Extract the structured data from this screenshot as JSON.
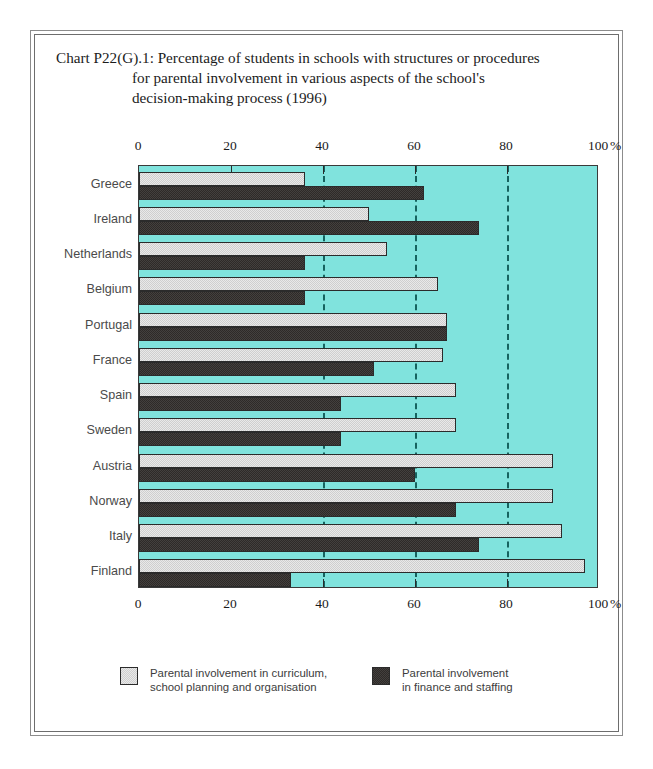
{
  "title": {
    "line1": "Chart P22(G).1: Percentage of students in schools with structures or procedures",
    "line2": "for parental involvement in various aspects of the school's",
    "line3": "decision-making process (1996)"
  },
  "axis": {
    "unit": "%",
    "ticks": [
      "0",
      "20",
      "40",
      "60",
      "80",
      "100"
    ]
  },
  "legend": {
    "items": [
      {
        "label": "Parental involvement in curriculum,\nschool planning and organisation",
        "color": "#cfcfcf",
        "swatch": "light"
      },
      {
        "label": "Parental involvement\nin finance and staffing",
        "color": "#2e2a28",
        "swatch": "dark"
      }
    ]
  },
  "colors": {
    "plot_background": "#80e3dd",
    "series_light": "#cfcfcf",
    "series_dark": "#2e2a28",
    "gridline": "#16635f",
    "frame": "#6d6d6d"
  },
  "chart_data": {
    "type": "bar",
    "orientation": "horizontal",
    "title": "Chart P22(G).1: Percentage of students in schools with structures or procedures for parental involvement in various aspects of the school's decision-making process (1996)",
    "xlabel": "%",
    "ylabel": "",
    "xlim": [
      0,
      100
    ],
    "xticks": [
      0,
      20,
      40,
      60,
      80,
      100
    ],
    "grid": true,
    "gridlines_dashed_at": [
      40,
      60,
      80
    ],
    "legend_position": "bottom",
    "categories": [
      "Greece",
      "Ireland",
      "Netherlands",
      "Belgium",
      "Portugal",
      "France",
      "Spain",
      "Sweden",
      "Austria",
      "Norway",
      "Italy",
      "Finland"
    ],
    "series": [
      {
        "name": "Parental involvement in curriculum, school planning and organisation",
        "color": "#cfcfcf",
        "values": [
          36,
          50,
          54,
          65,
          67,
          66,
          69,
          69,
          90,
          90,
          92,
          97
        ]
      },
      {
        "name": "Parental involvement in finance and staffing",
        "color": "#2e2a28",
        "values": [
          62,
          74,
          36,
          36,
          67,
          51,
          44,
          44,
          60,
          69,
          74,
          33
        ]
      }
    ]
  }
}
